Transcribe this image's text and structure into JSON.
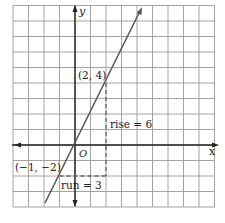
{
  "chart_data": {
    "type": "line",
    "title": "",
    "xlabel": "x",
    "ylabel": "y",
    "origin_label": "O",
    "xlim": [
      -4,
      9
    ],
    "ylim": [
      -4,
      9
    ],
    "grid": true,
    "series": [
      {
        "name": "line through (-1,-2) and (2,4)",
        "equation": "y = 2x",
        "x": [
          -2,
          4.2
        ],
        "y": [
          -4,
          8.4
        ]
      }
    ],
    "points": [
      {
        "label": "(2, 4)",
        "x": 2,
        "y": 4
      },
      {
        "label": "(−1, −2)",
        "x": -1,
        "y": -2
      }
    ],
    "annotations": [
      {
        "text": "rise = 6",
        "type": "vertical-dashed",
        "from": [
          2,
          -2
        ],
        "to": [
          2,
          4
        ]
      },
      {
        "text": "run = 3",
        "type": "horizontal-dashed",
        "from": [
          -1,
          -2
        ],
        "to": [
          2,
          -2
        ]
      }
    ]
  },
  "labels": {
    "x_axis": "x",
    "y_axis": "y",
    "origin": "O",
    "point_a": "(2, 4)",
    "point_b": "(−1, −2)",
    "rise": "rise = 6",
    "run": "run = 3"
  },
  "colors": {
    "grid": "#9a9a9a",
    "axis": "#222222",
    "line": "#555555",
    "dashed": "#666666",
    "text": "#222222"
  }
}
